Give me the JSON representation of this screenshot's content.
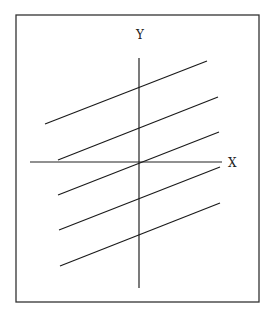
{
  "diagram": {
    "frame": {
      "x": 16,
      "y": 15,
      "width": 243,
      "height": 287,
      "stroke": "#333333"
    },
    "axes": {
      "x": {
        "label": "X",
        "x1": 30,
        "y1": 162,
        "x2": 222,
        "y2": 162,
        "label_x": 228,
        "label_y": 167
      },
      "y": {
        "label": "Y",
        "x1": 139,
        "y1": 58,
        "x2": 139,
        "y2": 288,
        "label_x": 136,
        "label_y": 39
      },
      "origin": {
        "x": 139,
        "y": 162
      },
      "stroke": "#222222"
    },
    "parallel_lines": [
      {
        "x1": 45,
        "y1": 124,
        "x2": 207,
        "y2": 61
      },
      {
        "x1": 58,
        "y1": 160,
        "x2": 218,
        "y2": 97
      },
      {
        "x1": 58,
        "y1": 195,
        "x2": 219,
        "y2": 132
      },
      {
        "x1": 59,
        "y1": 230,
        "x2": 220,
        "y2": 167
      },
      {
        "x1": 60,
        "y1": 266,
        "x2": 220,
        "y2": 203
      }
    ],
    "line_color": "#1a1a1a",
    "line_count": 5
  }
}
